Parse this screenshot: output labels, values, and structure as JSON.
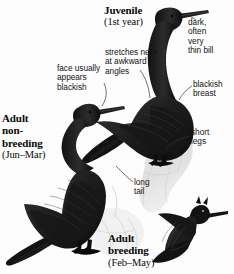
{
  "plate": {
    "subject": "Pelagic Cormorant plumages plate",
    "background_color": "#fdfdfd",
    "ink_color": "#111111",
    "bird_color": "#1a1a1a"
  },
  "captions": {
    "juvenile": {
      "title": "Juvenile",
      "sub": "(1st year)"
    },
    "adult_nonbreeding": {
      "line1": "Adult",
      "line2": "non-",
      "line3": "breeding",
      "sub": "(Jun–Mar)"
    },
    "adult_breeding": {
      "line1": "Adult",
      "line2": "breeding",
      "sub": "(Feb–May)"
    }
  },
  "annotations": {
    "face": {
      "l1": "face usually",
      "l2": "appears",
      "l3": "blackish"
    },
    "stretch": {
      "l1": "stretches neck",
      "l2": "at awkward",
      "l3": "angles"
    },
    "bill": {
      "l1": "dark,",
      "l2": "often",
      "l3": "very",
      "l4": "thin bill"
    },
    "breast": {
      "l1": "blackish",
      "l2": "breast"
    },
    "legs": {
      "l1": "short",
      "l2": "legs"
    },
    "tail": {
      "l1": "long",
      "l2": "tail"
    }
  },
  "figures": [
    {
      "name": "juvenile-cormorant",
      "pose": "standing upright, neck stretched"
    },
    {
      "name": "adult-nonbreeding-cormorant",
      "pose": "standing, S-curved neck"
    },
    {
      "name": "adult-breeding-cormorant",
      "pose": "flying silhouette"
    },
    {
      "name": "rock-perch",
      "pose": "pale gray rock"
    }
  ]
}
